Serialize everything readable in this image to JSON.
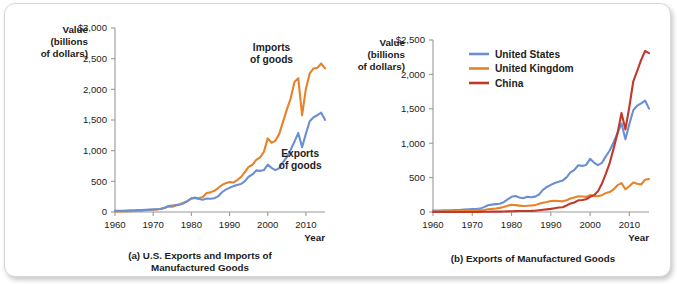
{
  "figure": {
    "background_color": "#ffffff",
    "colors": {
      "us_blue": "#6b8fd4",
      "uk_orange": "#e8822a",
      "china_red": "#c0392b",
      "axis_gray": "#9a9a9a",
      "text": "#1c1c1c"
    }
  },
  "chart_data": [
    {
      "type": "line",
      "panel_id": "a",
      "title": "(a) U.S. Exports and Imports of Manufactured Goods",
      "caption_line1": "(a) U.S. Exports and Imports of",
      "caption_line2": "Manufactured Goods",
      "ylabel_line1": "Value",
      "ylabel_line2": "(billions",
      "ylabel_line3": "of dollars)",
      "xlabel": "Year",
      "xlim": [
        1960,
        2015
      ],
      "ylim": [
        0,
        3000
      ],
      "grid": false,
      "ytick_labels": [
        "0",
        "500",
        "1,000",
        "1,500",
        "2,000",
        "2,500",
        "$3,000"
      ],
      "ytick_values": [
        0,
        500,
        1000,
        1500,
        2000,
        2500,
        3000
      ],
      "xtick_labels": [
        "1960",
        "1970",
        "1980",
        "1990",
        "2000",
        "2010"
      ],
      "xtick_values": [
        1960,
        1970,
        1980,
        1990,
        2000,
        2010
      ],
      "annotations": [
        {
          "text_line1": "Imports",
          "text_line2": "of goods",
          "x": 2001,
          "y": 2620,
          "color": "#1c1c1c"
        },
        {
          "text_line1": "Exports",
          "text_line2": "of goods",
          "x": 2008.5,
          "y": 900,
          "color": "#1c1c1c"
        }
      ],
      "x": [
        1960,
        1961,
        1962,
        1963,
        1964,
        1965,
        1966,
        1967,
        1968,
        1969,
        1970,
        1971,
        1972,
        1973,
        1974,
        1975,
        1976,
        1977,
        1978,
        1979,
        1980,
        1981,
        1982,
        1983,
        1984,
        1985,
        1986,
        1987,
        1988,
        1989,
        1990,
        1991,
        1992,
        1993,
        1994,
        1995,
        1996,
        1997,
        1998,
        1999,
        2000,
        2001,
        2002,
        2003,
        2004,
        2005,
        2006,
        2007,
        2008,
        2009,
        2010,
        2011,
        2012,
        2013,
        2014,
        2015
      ],
      "series": [
        {
          "name": "Imports of goods",
          "color": "#e8822a",
          "values": [
            10,
            10,
            11,
            12,
            14,
            17,
            21,
            23,
            28,
            32,
            36,
            42,
            53,
            64,
            88,
            85,
            105,
            125,
            150,
            175,
            222,
            230,
            225,
            245,
            310,
            320,
            345,
            390,
            440,
            470,
            490,
            480,
            520,
            570,
            650,
            735,
            770,
            850,
            890,
            980,
            1200,
            1130,
            1160,
            1270,
            1470,
            1670,
            1850,
            2120,
            2180,
            1580,
            2010,
            2260,
            2340,
            2350,
            2420,
            2340
          ],
          "label": "Imports of goods"
        },
        {
          "name": "Exports of goods",
          "color": "#6b8fd4",
          "values": [
            20,
            20,
            21,
            23,
            26,
            27,
            30,
            31,
            34,
            38,
            43,
            44,
            49,
            71,
            98,
            107,
            115,
            121,
            143,
            182,
            221,
            234,
            212,
            201,
            220,
            215,
            224,
            254,
            322,
            364,
            394,
            422,
            440,
            457,
            503,
            575,
            612,
            679,
            670,
            684,
            772,
            719,
            682,
            713,
            808,
            894,
            1016,
            1148,
            1287,
            1056,
            1278,
            1480,
            1545,
            1578,
            1620,
            1503
          ],
          "label": "Exports of goods"
        }
      ]
    },
    {
      "type": "line",
      "panel_id": "b",
      "title": "(b) Exports of Manufactured Goods",
      "caption_line1": "(b) Exports of Manufactured Goods",
      "caption_line2": "",
      "ylabel_line1": "Value",
      "ylabel_line2": "(billions",
      "ylabel_line3": "of dollars)",
      "xlabel": "Year",
      "xlim": [
        1960,
        2015
      ],
      "ylim": [
        0,
        2500
      ],
      "grid": false,
      "ytick_labels": [
        "0",
        "500",
        "1,000",
        "1,500",
        "2,000",
        "$2,500"
      ],
      "ytick_values": [
        0,
        500,
        1000,
        1500,
        2000,
        2500
      ],
      "xtick_labels": [
        "1960",
        "1970",
        "1980",
        "1990",
        "2000",
        "2010"
      ],
      "xtick_values": [
        1960,
        1970,
        1980,
        1990,
        2000,
        2010
      ],
      "legend_position": "top-left",
      "legend": [
        {
          "label": "United States",
          "color": "#6b8fd4"
        },
        {
          "label": "United Kingdom",
          "color": "#e8822a"
        },
        {
          "label": "China",
          "color": "#c0392b"
        }
      ],
      "x": [
        1960,
        1961,
        1962,
        1963,
        1964,
        1965,
        1966,
        1967,
        1968,
        1969,
        1970,
        1971,
        1972,
        1973,
        1974,
        1975,
        1976,
        1977,
        1978,
        1979,
        1980,
        1981,
        1982,
        1983,
        1984,
        1985,
        1986,
        1987,
        1988,
        1989,
        1990,
        1991,
        1992,
        1993,
        1994,
        1995,
        1996,
        1997,
        1998,
        1999,
        2000,
        2001,
        2002,
        2003,
        2004,
        2005,
        2006,
        2007,
        2008,
        2009,
        2010,
        2011,
        2012,
        2013,
        2014,
        2015
      ],
      "series": [
        {
          "name": "United States",
          "color": "#6b8fd4",
          "values": [
            20,
            20,
            21,
            23,
            26,
            27,
            30,
            31,
            34,
            38,
            43,
            44,
            49,
            71,
            98,
            107,
            115,
            121,
            143,
            182,
            221,
            234,
            212,
            201,
            220,
            215,
            224,
            254,
            322,
            364,
            394,
            422,
            440,
            457,
            503,
            575,
            612,
            679,
            670,
            684,
            772,
            719,
            682,
            713,
            808,
            894,
            1016,
            1148,
            1287,
            1056,
            1278,
            1480,
            1545,
            1578,
            1620,
            1503
          ]
        },
        {
          "name": "United Kingdom",
          "color": "#e8822a",
          "values": [
            8,
            8,
            9,
            9,
            10,
            11,
            12,
            12,
            14,
            16,
            18,
            21,
            23,
            29,
            40,
            45,
            50,
            60,
            73,
            90,
            105,
            100,
            93,
            88,
            90,
            95,
            100,
            120,
            135,
            145,
            160,
            162,
            160,
            155,
            172,
            197,
            212,
            228,
            225,
            220,
            245,
            235,
            230,
            245,
            275,
            290,
            330,
            390,
            420,
            330,
            375,
            430,
            410,
            400,
            470,
            480
          ]
        },
        {
          "name": "China",
          "color": "#c0392b",
          "values": [
            1,
            1,
            1,
            1,
            1,
            1,
            1,
            1,
            1,
            1,
            1,
            1,
            2,
            3,
            4,
            5,
            5,
            6,
            7,
            9,
            11,
            13,
            14,
            14,
            15,
            16,
            19,
            25,
            32,
            38,
            45,
            55,
            65,
            70,
            95,
            125,
            138,
            170,
            175,
            185,
            220,
            245,
            300,
            410,
            555,
            715,
            925,
            1150,
            1440,
            1200,
            1530,
            1900,
            2050,
            2210,
            2340,
            2310
          ]
        }
      ]
    }
  ]
}
